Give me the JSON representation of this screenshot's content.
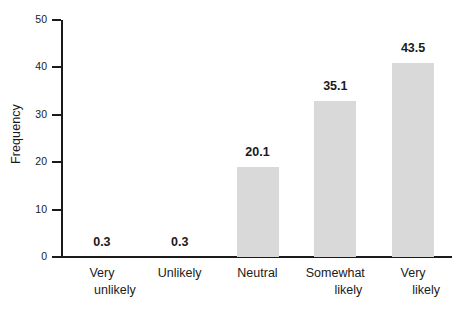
{
  "chart_data": {
    "type": "bar",
    "title": "",
    "xlabel": "",
    "ylabel": "Frequency",
    "categories": [
      "Very unlikely",
      "Unlikely",
      "Neutral",
      "Somewhat likely",
      "Very likely"
    ],
    "category_lines": [
      [
        "Very",
        "unlikely"
      ],
      [
        "Unlikely",
        ""
      ],
      [
        "Neutral",
        ""
      ],
      [
        "Somewhat",
        "likely"
      ],
      [
        "Very",
        "likely"
      ]
    ],
    "values": [
      0.3,
      0.3,
      20.1,
      35.1,
      43.5
    ],
    "data_labels": [
      "0.3",
      "0.3",
      "20.1",
      "35.1",
      "43.5"
    ],
    "bar_plotted_values": [
      0,
      0,
      19.0,
      33.0,
      41.0
    ],
    "ylim": [
      0,
      50
    ],
    "yticks": [
      0,
      10,
      20,
      30,
      40,
      50
    ],
    "ytick_labels": [
      "0",
      "10",
      "20",
      "30",
      "40",
      "50"
    ],
    "grid": false,
    "legend": false,
    "bar_color": "#d9d9d9",
    "axis_color": "#1b1b1b",
    "background_color": "#ffffff"
  }
}
